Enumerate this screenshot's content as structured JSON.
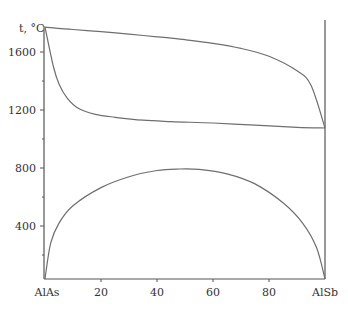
{
  "chart_data": {
    "type": "line",
    "title": "",
    "xlabel": "",
    "ylabel": "t, °C",
    "x_range": [
      0,
      100
    ],
    "ylim": [
      0,
      1780
    ],
    "x_end_labels": {
      "left": "AlAs",
      "right": "AlSb"
    },
    "x_ticks": [
      20,
      40,
      60,
      80
    ],
    "x_tick_labels": [
      "20",
      "40",
      "60",
      "80"
    ],
    "y_ticks_major": [
      400,
      800,
      1200,
      1600
    ],
    "y_tick_labels": [
      "400",
      "800",
      "1200",
      "1600"
    ],
    "y_ticks_minor": [
      200,
      600,
      1000,
      1400
    ],
    "grid": false,
    "legend": null,
    "series": [
      {
        "name": "liquidus",
        "x": [
          0,
          10,
          20,
          30,
          40,
          50,
          60,
          70,
          80,
          90,
          95,
          100
        ],
        "y": [
          1772,
          1755,
          1740,
          1723,
          1705,
          1685,
          1660,
          1625,
          1570,
          1470,
          1370,
          1076
        ]
      },
      {
        "name": "solidus",
        "x": [
          0,
          3,
          5,
          8,
          12,
          18,
          25,
          35,
          45,
          60,
          75,
          90,
          100
        ],
        "y": [
          1772,
          1500,
          1380,
          1280,
          1210,
          1170,
          1150,
          1130,
          1120,
          1110,
          1095,
          1080,
          1076
        ]
      },
      {
        "name": "miscibility-gap",
        "x": [
          0,
          2,
          5,
          10,
          20,
          30,
          40,
          48,
          55,
          65,
          75,
          85,
          92,
          97,
          100
        ],
        "y": [
          35,
          280,
          420,
          540,
          665,
          740,
          783,
          793,
          790,
          760,
          690,
          560,
          420,
          250,
          35
        ]
      },
      {
        "name": "AlSb-line",
        "x": [
          100,
          100
        ],
        "y": [
          35,
          1920
        ]
      }
    ]
  }
}
